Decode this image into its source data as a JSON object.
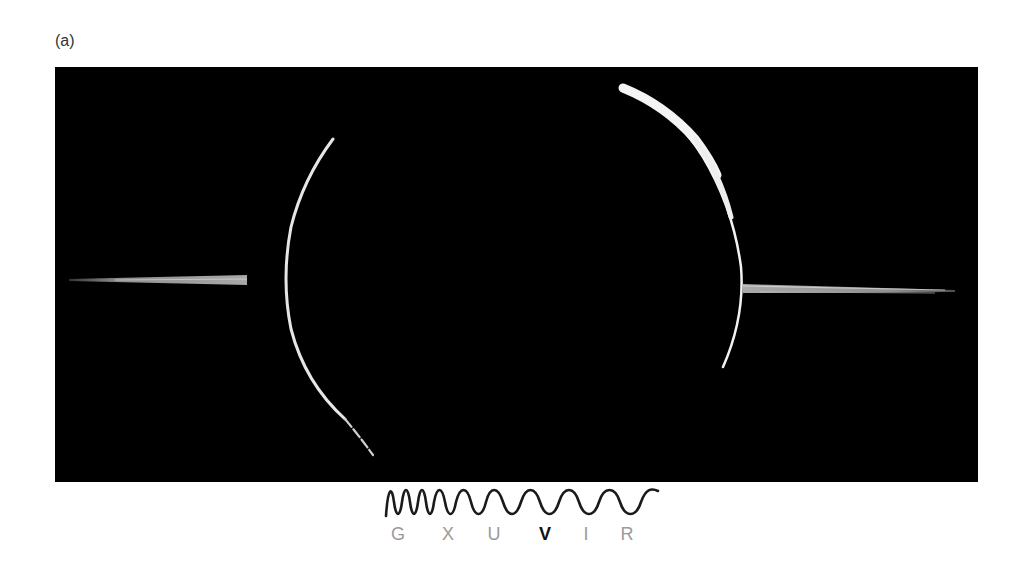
{
  "figure": {
    "panel_label": "(a)",
    "image": {
      "description": "Black background image of a ring system: two bright arcs and two horizontal streaks",
      "background_color": "#000000",
      "arc_color": "#e8e8e8"
    },
    "spectrum": {
      "bands": [
        {
          "label": "G",
          "highlighted": false
        },
        {
          "label": "X",
          "highlighted": false
        },
        {
          "label": "U",
          "highlighted": false
        },
        {
          "label": "V",
          "highlighted": true
        },
        {
          "label": "I",
          "highlighted": false
        },
        {
          "label": "R",
          "highlighted": false
        }
      ],
      "inactive_color": "#9a9a9a",
      "active_color": "#111111"
    }
  }
}
